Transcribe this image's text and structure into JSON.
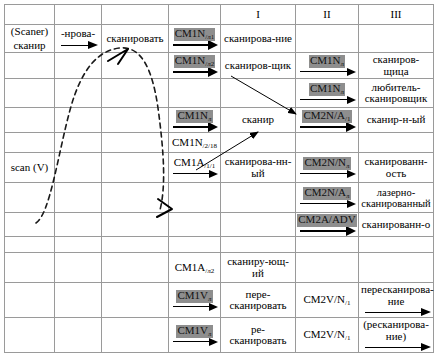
{
  "figure": {
    "headers": {
      "col1": "I",
      "col2": "II",
      "col3": "III"
    },
    "source": {
      "line1": "(Scaner)",
      "line2": "сканир"
    },
    "affix": "-нрова-",
    "verb": "сканировать",
    "scan_v": "scan (V)"
  },
  "rows": [
    {
      "cm_a": "CM1N",
      "cm_a_sub": "/л1",
      "col1": "сканирова-ние",
      "cm_b": "",
      "cm_b_sub": "",
      "col3": ""
    },
    {
      "cm_a": "CM1N",
      "cm_a_sub": "/л2",
      "col1": "сканиров-щик",
      "cm_b": "CM1N",
      "cm_b_sub": "л",
      "col3": "сканиров-щица"
    },
    {
      "cm_a": "",
      "cm_a_sub": "",
      "col1": "",
      "cm_b": "CM1N",
      "cm_b_sub": "л",
      "col3": "любитель-\nсканировщик"
    },
    {
      "cm_a": "CM1N",
      "cm_a_sub": "л",
      "col1": "сканир",
      "cm_b": "CM2N/A",
      "cm_b_sub": "/1",
      "col3": "сканир-н-ый"
    },
    {
      "cm_a": "CM1N",
      "cm_a_sub": "/2/18",
      "col1": "",
      "cm_b": "",
      "cm_b_sub": "",
      "col3": ""
    },
    {
      "cm_a": "CM1A",
      "cm_a_sub": "/1/1",
      "col1": "сканирова-нн-ый",
      "cm_b": "CM2N/N",
      "cm_b_sub": "л",
      "col3": "сканированн-\nость"
    },
    {
      "cm_a": "",
      "cm_a_sub": "",
      "col1": "",
      "cm_b": "CM2N/A",
      "cm_b_sub": "л",
      "col3": "лазерно-\nсканированный"
    },
    {
      "cm_a": "",
      "cm_a_sub": "",
      "col1": "",
      "cm_b": "CM2A/ADV",
      "cm_b_sub": "",
      "col3": "сканированн-о"
    },
    {
      "cm_a": "CM1A",
      "cm_a_sub": "/л2",
      "col1": "сканиру-ющ-ий",
      "cm_b": "",
      "cm_b_sub": "",
      "col3": ""
    },
    {
      "cm_a": "CM1V",
      "cm_a_sub": "л",
      "col1": "пере-\nсканировать",
      "cm_b": "CM2V/N",
      "cm_b_sub": "/1",
      "col3": "пересканирова-\nние"
    },
    {
      "cm_a": "CM1V",
      "cm_a_sub": "л",
      "col1": "ре-\nсканировать",
      "cm_b": "CM2V/N",
      "cm_b_sub": "/1",
      "col3": "(ресканирова-\nние)"
    }
  ],
  "colors": {
    "highlight": "#8e8e8e",
    "gridline": "#9a9a9a",
    "ink": "#000000",
    "page": "#ffffff"
  }
}
